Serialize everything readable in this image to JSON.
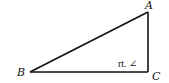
{
  "figure": {
    "type": "right-triangle",
    "vertices": {
      "A": {
        "label": "A",
        "x": 148,
        "y": 12
      },
      "B": {
        "label": "B",
        "x": 30,
        "y": 72
      },
      "C": {
        "label": "C",
        "x": 148,
        "y": 72
      }
    },
    "sides": [
      "AB",
      "BC",
      "CA"
    ],
    "right_angle_annotation": "rt. ∠",
    "right_angle_at": "C",
    "stroke_color": "#111111"
  }
}
